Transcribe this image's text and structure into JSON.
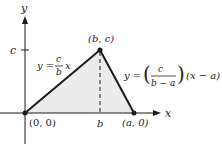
{
  "diagram": {
    "axes": {
      "x_label": "x",
      "y_label": "y"
    },
    "points": {
      "origin": "(0, 0)",
      "peak": "(b, c)",
      "right": "(a, 0)"
    },
    "ticks": {
      "x_tick": "b",
      "y_tick": "c"
    },
    "left_line": {
      "lhs": "y =",
      "frac_num": "c",
      "frac_den": "b",
      "rhs": "x"
    },
    "right_line": {
      "lhs": "y =",
      "frac_num": "c",
      "frac_den": "b − a",
      "rhs": "(x − a)"
    },
    "colors": {
      "stroke": "#1a1a1a",
      "fill": "#ececec"
    }
  }
}
